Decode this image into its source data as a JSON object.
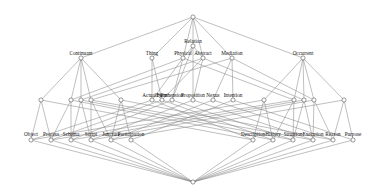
{
  "diagram": {
    "type": "lattice",
    "title": "",
    "top_node": {
      "x": 193,
      "y": 17
    },
    "bottom_node": {
      "x": 193,
      "y": 182
    },
    "level1": [
      {
        "label": "Continuant",
        "x": 81,
        "y": 58
      },
      {
        "label": "Thing",
        "x": 152,
        "y": 58
      },
      {
        "label": "Physical",
        "x": 183,
        "y": 58
      },
      {
        "label": "Relation",
        "x": 193,
        "y": 46
      },
      {
        "label": "Abstract",
        "x": 203,
        "y": 58
      },
      {
        "label": "Mediation",
        "x": 232,
        "y": 58
      },
      {
        "label": "Occurrent",
        "x": 303,
        "y": 58
      }
    ],
    "level2": [
      {
        "label": "Actuality",
        "x": 152,
        "y": 100
      },
      {
        "label": "Form",
        "x": 162,
        "y": 100
      },
      {
        "label": "Prehension",
        "x": 172,
        "y": 100
      },
      {
        "label": "Proposition",
        "x": 193,
        "y": 100
      },
      {
        "label": "Nexus",
        "x": 213,
        "y": 100
      },
      {
        "label": "Intention",
        "x": 233,
        "y": 100
      }
    ],
    "level3": [
      {
        "label": "Object",
        "x": 31,
        "y": 140
      },
      {
        "label": "Process",
        "x": 51,
        "y": 140
      },
      {
        "label": "Schema",
        "x": 71,
        "y": 140
      },
      {
        "label": "Script",
        "x": 91,
        "y": 140
      },
      {
        "label": "Juncture",
        "x": 111,
        "y": 140
      },
      {
        "label": "Participation",
        "x": 131,
        "y": 140
      },
      {
        "label": "Description",
        "x": 253,
        "y": 140
      },
      {
        "label": "History",
        "x": 273,
        "y": 140
      },
      {
        "label": "Situation",
        "x": 293,
        "y": 140
      },
      {
        "label": "Execution",
        "x": 313,
        "y": 140
      },
      {
        "label": "Reason",
        "x": 333,
        "y": 140
      },
      {
        "label": "Purpose",
        "x": 353,
        "y": 140
      }
    ],
    "colors": {
      "edge": "#8a8a8a",
      "node_stroke": "#555555",
      "text": "#111111",
      "background": "#ffffff"
    }
  }
}
